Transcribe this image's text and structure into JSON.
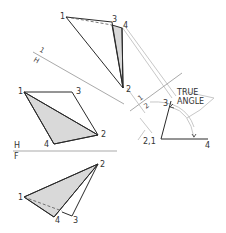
{
  "figure": {
    "annotation": {
      "line1": "TRUE",
      "line2": "ANGLE"
    },
    "fold_lines": {
      "h_1": {
        "upper": "1",
        "lower": "H"
      },
      "h_f": {
        "upper": "H",
        "lower": "F"
      },
      "one_two": {
        "upper": "1",
        "lower": "2"
      }
    },
    "view_auxiliary_1": {
      "points": {
        "p1": "1",
        "p3": "3",
        "p4": "4",
        "p2": "2"
      }
    },
    "view_top": {
      "points": {
        "p1": "1",
        "p3": "3",
        "p2": "2",
        "p4": "4"
      }
    },
    "view_front": {
      "points": {
        "p1": "1",
        "p2": "2",
        "p4": "4",
        "p3": "3"
      }
    },
    "view_auxiliary_2": {
      "points": {
        "p3": "3",
        "p21": "2,1",
        "p4": "4"
      }
    },
    "colors": {
      "line": "#2a2a2a",
      "shade": "#d9d9d9",
      "projection": "#c8c8c8"
    }
  }
}
